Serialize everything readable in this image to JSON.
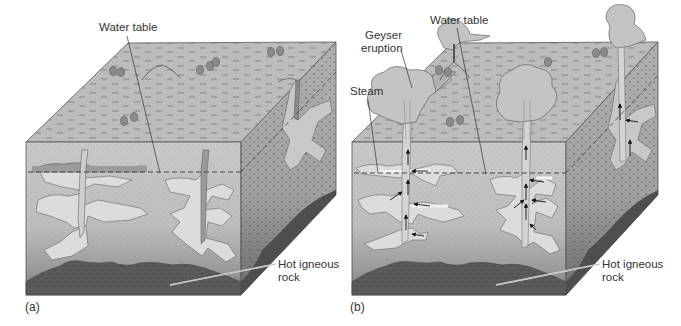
{
  "figure": {
    "panels": [
      {
        "id": "a",
        "panel_label": "(a)",
        "labels": {
          "water_table": "Water table",
          "hot_igneous_rock_line1": "Hot igneous",
          "hot_igneous_rock_line2": "rock"
        }
      },
      {
        "id": "b",
        "panel_label": "(b)",
        "labels": {
          "geyser_eruption_line1": "Geyser",
          "geyser_eruption_line2": "eruption",
          "water_table": "Water table",
          "steam": "Steam",
          "hot_igneous_rock_line1": "Hot igneous",
          "hot_igneous_rock_line2": "rock"
        }
      }
    ],
    "colors": {
      "surface": "#bcbcbc",
      "front_upper": "#c6c6c6",
      "front_lower": "#b0b0b0",
      "side_face": "#a8a8a8",
      "water_pockets": "#dcdcdc",
      "saturated_band": "#9a9a9a",
      "igneous_rock": "#555555",
      "outline": "#555555",
      "label_text": "#333333"
    }
  }
}
